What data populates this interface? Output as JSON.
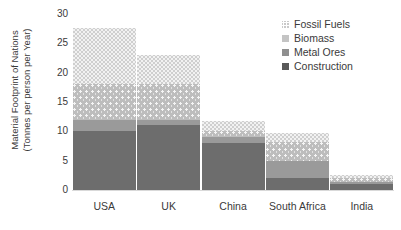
{
  "chart_data": {
    "type": "bar",
    "stacked": true,
    "orientation": "vertical",
    "title": "",
    "xlabel": "",
    "ylabel_line1": "Material Footprint of Nations",
    "ylabel_line2": "(Tonnes per person per Year)",
    "categories": [
      "USA",
      "UK",
      "China",
      "South Africa",
      "India"
    ],
    "ylim": [
      0,
      30
    ],
    "ytick_labels": [
      "0",
      "5",
      "10",
      "15",
      "20",
      "25",
      "30"
    ],
    "ytick_values": [
      0,
      5,
      10,
      15,
      20,
      25,
      30
    ],
    "grid": false,
    "legend_position": "top-right",
    "series": [
      {
        "name": "Construction",
        "color": "#6d6d6d",
        "swatch": "solid-dark-gray",
        "values": [
          10.0,
          11.0,
          8.0,
          2.0,
          1.0
        ]
      },
      {
        "name": "Metal Ores",
        "color": "#9a9a9a",
        "swatch": "solid-medium-gray",
        "values": [
          2.0,
          1.0,
          1.0,
          3.0,
          0.4
        ]
      },
      {
        "name": "Biomass",
        "color": "#bdbdbd",
        "swatch": "dotted-light-gray",
        "values": [
          6.0,
          6.0,
          1.0,
          3.2,
          0.7
        ]
      },
      {
        "name": "Fossil Fuels",
        "color": "#f2f2f2",
        "swatch": "zigzag-very-light-gray",
        "values": [
          9.6,
          5.0,
          1.7,
          1.5,
          0.4
        ]
      }
    ],
    "totals": [
      27.6,
      23.0,
      11.7,
      9.7,
      2.5
    ],
    "series_order_bottom_to_top": [
      "Construction",
      "Metal Ores",
      "Biomass",
      "Fossil Fuels"
    ],
    "legend_order_top_to_bottom": [
      "Fossil Fuels",
      "Biomass",
      "Metal Ores",
      "Construction"
    ]
  }
}
